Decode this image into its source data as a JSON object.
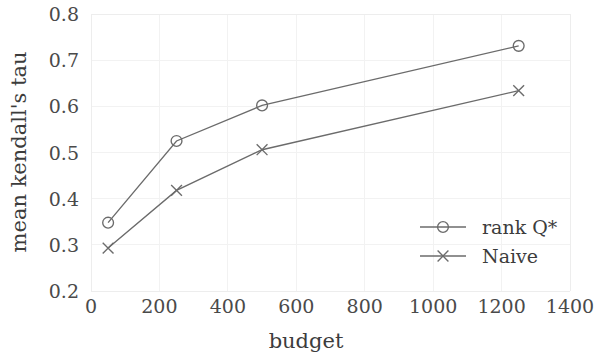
{
  "chart_data": {
    "type": "line",
    "title": "",
    "subtitle": "",
    "xlabel": "budget",
    "ylabel": "mean kendall's tau",
    "xlim": [
      0,
      1400
    ],
    "ylim": [
      0.2,
      0.8
    ],
    "xticks": [
      0,
      200,
      400,
      600,
      800,
      1000,
      1200,
      1400
    ],
    "xtick_labels": [
      "0",
      "200",
      "400",
      "600",
      "800",
      "1000",
      "1200",
      "1400"
    ],
    "yticks": [
      0.2,
      0.3,
      0.4,
      0.5,
      0.6,
      0.7,
      0.8
    ],
    "ytick_labels": [
      "0.2",
      "0.3",
      "0.4",
      "0.5",
      "0.6",
      "0.7",
      "0.8"
    ],
    "grid": true,
    "grid_color": "#f2f2f2",
    "legend_position": "lower right",
    "line_color": "#6b6b6b",
    "x": [
      50,
      250,
      500,
      1250
    ],
    "series": [
      {
        "name": "rank Q*",
        "marker": "circle",
        "values": [
          0.348,
          0.525,
          0.602,
          0.731
        ]
      },
      {
        "name": "Naive",
        "marker": "x",
        "values": [
          0.293,
          0.418,
          0.506,
          0.634
        ]
      }
    ]
  },
  "legend": {
    "entries": [
      {
        "label": "rank Q*",
        "marker": "circle"
      },
      {
        "label": "Naive",
        "marker": "x"
      }
    ]
  }
}
